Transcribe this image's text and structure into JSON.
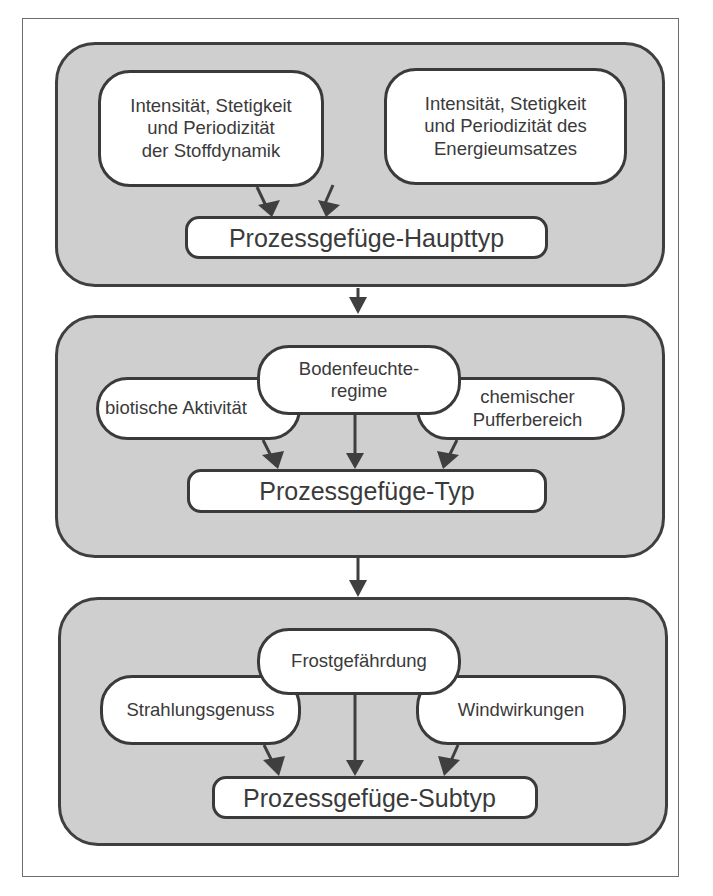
{
  "diagram": {
    "levels": [
      {
        "id": "level-1",
        "factors": [
          {
            "id": "stoffdynamik",
            "lines": [
              "Intensität, Stetigkeit",
              "und Periodizität",
              "der Stoffdynamik"
            ]
          },
          {
            "id": "energieumsatz",
            "lines": [
              "Intensität, Stetigkeit",
              "und Periodizität des",
              "Energieumsatzes"
            ]
          }
        ],
        "result": "Prozessgefüge-Haupttyp"
      },
      {
        "id": "level-2",
        "factors": [
          {
            "id": "bodenfeuchteregime",
            "lines": [
              "Bodenfeuchte-",
              "regime"
            ]
          },
          {
            "id": "biotische-aktivitaet",
            "lines": [
              "biotische Aktivität"
            ]
          },
          {
            "id": "chemischer-pufferbereich",
            "lines": [
              "chemischer",
              "Pufferbereich"
            ]
          }
        ],
        "result": "Prozessgefüge-Typ"
      },
      {
        "id": "level-3",
        "factors": [
          {
            "id": "frostgefaehrdung",
            "lines": [
              "Frostgefährdung"
            ]
          },
          {
            "id": "strahlungsgenuss",
            "lines": [
              "Strahlungsgenuss"
            ]
          },
          {
            "id": "windwirkungen",
            "lines": [
              "Windwirkungen"
            ]
          }
        ],
        "result": "Prozessgefüge-Subtyp"
      }
    ],
    "edges": [
      {
        "from": "stoffdynamik",
        "to": "Prozessgefüge-Haupttyp"
      },
      {
        "from": "energieumsatz",
        "to": "Prozessgefüge-Haupttyp"
      },
      {
        "from": "level-1",
        "to": "level-2"
      },
      {
        "from": "bodenfeuchteregime",
        "to": "Prozessgefüge-Typ"
      },
      {
        "from": "biotische-aktivitaet",
        "to": "Prozessgefüge-Typ"
      },
      {
        "from": "chemischer-pufferbereich",
        "to": "Prozessgefüge-Typ"
      },
      {
        "from": "level-2",
        "to": "level-3"
      },
      {
        "from": "frostgefaehrdung",
        "to": "Prozessgefüge-Subtyp"
      },
      {
        "from": "strahlungsgenuss",
        "to": "Prozessgefüge-Subtyp"
      },
      {
        "from": "windwirkungen",
        "to": "Prozessgefüge-Subtyp"
      }
    ],
    "colors": {
      "panel_fill": "#cfcfcf",
      "panel_border": "#3f3f3f",
      "box_fill": "#ffffff",
      "text": "#3a3a3a",
      "arrow": "#3f3f3f"
    }
  }
}
